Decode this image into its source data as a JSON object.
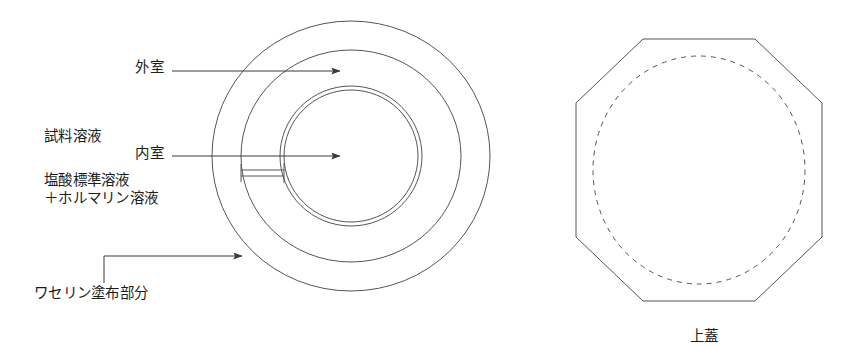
{
  "figure": {
    "stroke_color": "#555555",
    "background_color": "#ffffff",
    "width": 866,
    "height": 364
  },
  "labels": {
    "outer_chamber": "外室",
    "sample_solution_line1": "試料溶液",
    "sample_solution_line2": "＋ホルマリン溶液",
    "inner_chamber": "内室",
    "hcl_standard_solution": "塩酸標準溶液",
    "vaseline_coating": "ワセリン塗布部分",
    "lid_caption": "上蓋"
  },
  "drawing": {
    "left_view": {
      "name": "concentric-dish-top-view",
      "center_x": 351,
      "center_y": 156,
      "circles": [
        {
          "name": "outer-rim-outer-circle",
          "rx": 139,
          "ry": 135
        },
        {
          "name": "outer-rim-inner-circle",
          "rx": 110,
          "ry": 106
        },
        {
          "name": "inner-vessel-outer-circle",
          "rx": 71,
          "ry": 70
        },
        {
          "name": "inner-vessel-inner-circle",
          "rx": 67,
          "ry": 66
        }
      ],
      "connector": {
        "name": "inner-outer-connector-bridge",
        "x1": 241,
        "x2": 284,
        "y_top": 170,
        "y_bottom": 176
      }
    },
    "right_view": {
      "name": "octagonal-lid-top-view",
      "octagon_points": "643,39 755,39 822,103 822,237 755,301 643,301 576,237 576,103",
      "dashed_circle": {
        "cx": 699,
        "cy": 170,
        "rx": 106,
        "ry": 114
      }
    },
    "leaders": [
      {
        "name": "leader-outer-chamber",
        "x1": 172,
        "y1": 71,
        "x2": 340,
        "y2": 71,
        "arrow": true
      },
      {
        "name": "leader-inner-chamber",
        "x1": 172,
        "y1": 156,
        "x2": 340,
        "y2": 156,
        "arrow": true
      },
      {
        "name": "leader-vaseline",
        "path": "M104,283 L104,256 L242,256",
        "arrow": true
      }
    ]
  }
}
